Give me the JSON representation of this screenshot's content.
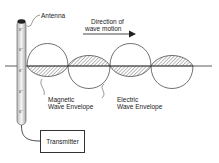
{
  "diagram": {
    "labels": {
      "antenna": "Antenna",
      "direction_line1": "Direction of",
      "direction_line2": "wave motion",
      "magnetic_line1": "Magnetic",
      "magnetic_line2": "Wave Envelope",
      "electric_line1": "Electric",
      "electric_line2": "Wave Envelope",
      "transmitter": "Transmitter"
    },
    "antenna_marks": [
      "6\"",
      "6\"",
      "6\"",
      "6\"",
      "6\""
    ],
    "colors": {
      "stroke": "#333333",
      "hatch": "#555555",
      "background": "#ffffff"
    }
  }
}
